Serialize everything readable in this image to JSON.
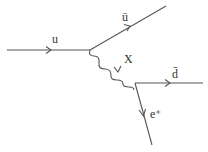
{
  "diagram": {
    "type": "feynman",
    "particles": {
      "incoming_quark": {
        "label": "u"
      },
      "outgoing_antiquark_u": {
        "label": "ū"
      },
      "mediator": {
        "label": "X"
      },
      "outgoing_antiquark_d": {
        "label": "d̄"
      },
      "outgoing_positron": {
        "label": "e⁺"
      }
    },
    "colors": {
      "line": "#555555",
      "text": "#333333"
    }
  }
}
